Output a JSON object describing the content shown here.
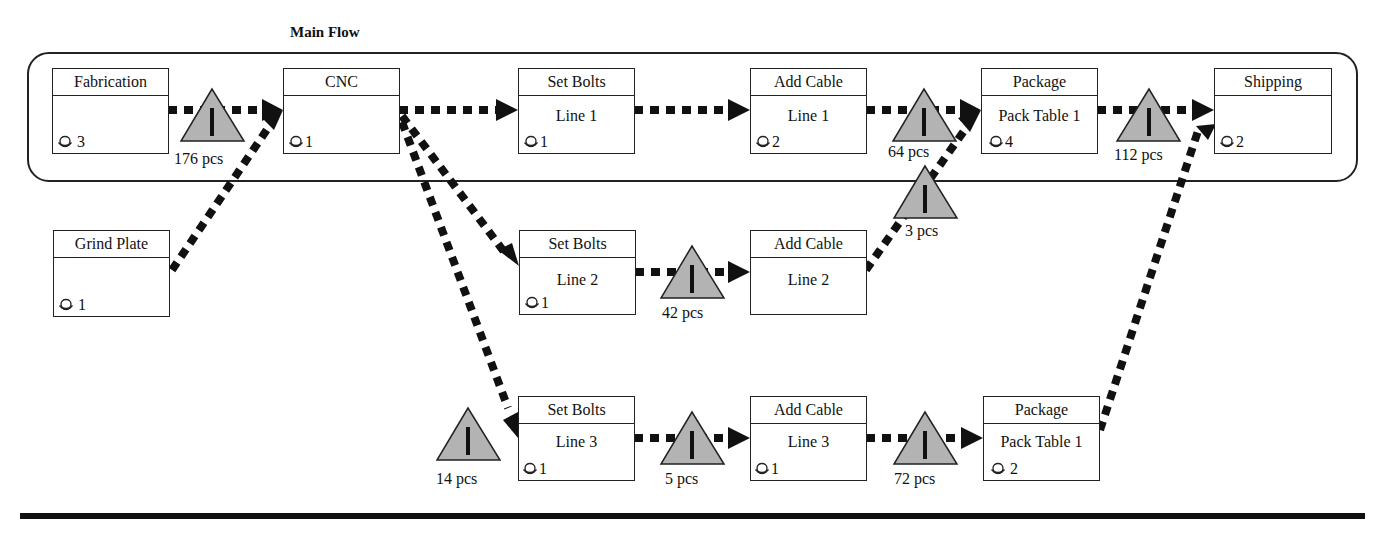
{
  "title": "Main Flow",
  "colors": {
    "line": "#111111",
    "inventory_fill": "#b3b3b3",
    "box_border": "#222222",
    "background": "#ffffff"
  },
  "processes": {
    "fabrication": {
      "name": "Fabrication",
      "sub": "",
      "operators": "3"
    },
    "cnc": {
      "name": "CNC",
      "sub": "",
      "operators": "1"
    },
    "set_bolts_1": {
      "name": "Set Bolts",
      "sub": "Line 1",
      "operators": "1"
    },
    "add_cable_1": {
      "name": "Add Cable",
      "sub": "Line 1",
      "operators": "2"
    },
    "package_1": {
      "name": "Package",
      "sub": "Pack Table 1",
      "operators": "4"
    },
    "shipping": {
      "name": "Shipping",
      "sub": "",
      "operators": "2"
    },
    "grind_plate": {
      "name": "Grind Plate",
      "sub": "",
      "operators": "1"
    },
    "set_bolts_2": {
      "name": "Set Bolts",
      "sub": "Line 2",
      "operators": "1"
    },
    "add_cable_2": {
      "name": "Add Cable",
      "sub": "Line 2",
      "operators": ""
    },
    "set_bolts_3": {
      "name": "Set Bolts",
      "sub": "Line 3",
      "operators": "1"
    },
    "add_cable_3": {
      "name": "Add Cable",
      "sub": "Line 3",
      "operators": "1"
    },
    "package_3": {
      "name": "Package",
      "sub": "Pack Table 1",
      "operators": "2"
    }
  },
  "inventory": {
    "fab_cnc": "176 pcs",
    "cable1_pack": "64 pcs",
    "cable2_pack": "3 pcs",
    "pack_ship": "112 pcs",
    "bolts2_cable2": "42 pcs",
    "before_bolts3": "14 pcs",
    "bolts3_cable3": "5 pcs",
    "cable3_pack3": "72 pcs"
  },
  "icons": {
    "operator": "operator-icon",
    "inventory": "inventory-triangle-icon",
    "push_arrow": "push-arrow-icon"
  }
}
